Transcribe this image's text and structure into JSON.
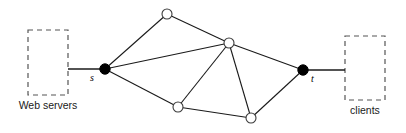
{
  "figure": {
    "type": "network-flow-diagram",
    "width": 406,
    "height": 133,
    "background_color": "#ffffff"
  },
  "colors": {
    "edge": "#1a1a1a",
    "terminal_node_fill": "#000000",
    "relay_node_fill": "#ffffff",
    "relay_node_stroke": "#3c3c3c",
    "box_stroke": "#555555",
    "text": "#1a1a1a"
  },
  "groups": [
    {
      "id": "web-servers",
      "label": "Web servers",
      "x": 28,
      "y": 30,
      "width": 40,
      "height": 65,
      "label_x": 14,
      "label_y": 100,
      "label_width": 68
    },
    {
      "id": "clients",
      "label": "clients",
      "x": 345,
      "y": 36,
      "width": 40,
      "height": 64,
      "label_x": 341,
      "label_y": 105,
      "label_width": 48
    }
  ],
  "nodes": [
    {
      "id": "s",
      "label": "s",
      "kind": "terminal",
      "cx": 105,
      "cy": 69,
      "r": 5.2,
      "label_x": 90,
      "label_y": 73
    },
    {
      "id": "v1",
      "label": "",
      "kind": "relay",
      "cx": 167,
      "cy": 14,
      "r": 5.0,
      "label_x": 0,
      "label_y": 0
    },
    {
      "id": "v2",
      "label": "",
      "kind": "relay",
      "cx": 229,
      "cy": 43,
      "r": 5.0,
      "label_x": 0,
      "label_y": 0
    },
    {
      "id": "v3",
      "label": "",
      "kind": "relay",
      "cx": 178,
      "cy": 107,
      "r": 5.0,
      "label_x": 0,
      "label_y": 0
    },
    {
      "id": "v4",
      "label": "",
      "kind": "relay",
      "cx": 251,
      "cy": 118,
      "r": 5.0,
      "label_x": 0,
      "label_y": 0
    },
    {
      "id": "t",
      "label": "t",
      "kind": "terminal",
      "cx": 303,
      "cy": 70,
      "r": 5.2,
      "label_x": 311,
      "label_y": 74
    }
  ],
  "edges": [
    {
      "from": "s",
      "to": "v1"
    },
    {
      "from": "s",
      "to": "v2"
    },
    {
      "from": "s",
      "to": "v3"
    },
    {
      "from": "v1",
      "to": "v2"
    },
    {
      "from": "v2",
      "to": "v3"
    },
    {
      "from": "v2",
      "to": "v4"
    },
    {
      "from": "v2",
      "to": "t"
    },
    {
      "from": "v3",
      "to": "v4"
    },
    {
      "from": "v4",
      "to": "t"
    }
  ],
  "stubs": [
    {
      "id": "web-servers-to-s",
      "x1": 68,
      "y1": 69,
      "x2": 105,
      "y2": 69
    },
    {
      "id": "t-to-clients",
      "x1": 303,
      "y1": 70,
      "x2": 345,
      "y2": 70
    }
  ]
}
